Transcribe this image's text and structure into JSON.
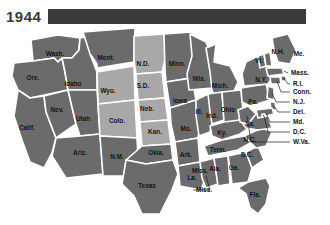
{
  "header": {
    "year": "1944",
    "bar_color": "#3a3a3a"
  },
  "legend": {
    "dark_color": "#6b6b6b",
    "light_color": "#a8a8a8",
    "border_color": "#ffffff"
  },
  "map": {
    "title": "1944",
    "states": [
      {
        "code": "WA",
        "label": "Wash.",
        "shade": "dark",
        "lx": 55,
        "ly": 26
      },
      {
        "code": "OR",
        "label": "Ore.",
        "shade": "dark",
        "lx": 33,
        "ly": 50
      },
      {
        "code": "CA",
        "label": "Calif.",
        "shade": "dark",
        "lx": 27,
        "ly": 100
      },
      {
        "code": "NV",
        "label": "Nev.",
        "shade": "dark",
        "lx": 57,
        "ly": 82
      },
      {
        "code": "ID",
        "label": "Idaho",
        "shade": "dark",
        "lx": 73,
        "ly": 56
      },
      {
        "code": "MT",
        "label": "Mont.",
        "shade": "dark",
        "lx": 106,
        "ly": 30
      },
      {
        "code": "WY",
        "label": "Wyo.",
        "shade": "light",
        "lx": 108,
        "ly": 63
      },
      {
        "code": "UT",
        "label": "Utah",
        "shade": "dark",
        "lx": 83,
        "ly": 91
      },
      {
        "code": "AZ",
        "label": "Ariz.",
        "shade": "dark",
        "lx": 80,
        "ly": 125
      },
      {
        "code": "CO",
        "label": "Colo.",
        "shade": "light",
        "lx": 117,
        "ly": 93
      },
      {
        "code": "NM",
        "label": "N.M.",
        "shade": "dark",
        "lx": 117,
        "ly": 129
      },
      {
        "code": "ND",
        "label": "N.D.",
        "shade": "light",
        "lx": 143,
        "ly": 36
      },
      {
        "code": "SD",
        "label": "S.D.",
        "shade": "light",
        "lx": 143,
        "ly": 58
      },
      {
        "code": "NE",
        "label": "Neb.",
        "shade": "light",
        "lx": 147,
        "ly": 81
      },
      {
        "code": "KS",
        "label": "Kan.",
        "shade": "light",
        "lx": 155,
        "ly": 104
      },
      {
        "code": "OK",
        "label": "Okla.",
        "shade": "dark",
        "lx": 156,
        "ly": 125
      },
      {
        "code": "TX",
        "label": "Texas",
        "shade": "dark",
        "lx": 147,
        "ly": 158
      },
      {
        "code": "MN",
        "label": "Minn.",
        "shade": "dark",
        "lx": 177,
        "ly": 36
      },
      {
        "code": "IA",
        "label": "Iowa",
        "shade": "dark",
        "lx": 180,
        "ly": 73
      },
      {
        "code": "MO",
        "label": "Mo.",
        "shade": "dark",
        "lx": 186,
        "ly": 101
      },
      {
        "code": "AR",
        "label": "Ark.",
        "shade": "dark",
        "lx": 186,
        "ly": 127
      },
      {
        "code": "LA",
        "label": "La.",
        "shade": "dark",
        "lx": 192,
        "ly": 150
      },
      {
        "code": "WI",
        "label": "Wis.",
        "shade": "dark",
        "lx": 199,
        "ly": 51
      },
      {
        "code": "IL",
        "label": "Ill.",
        "shade": "dark",
        "lx": 199,
        "ly": 84
      },
      {
        "code": "MI",
        "label": "Mich.",
        "shade": "dark",
        "lx": 220,
        "ly": 58
      },
      {
        "code": "IN",
        "label": "Ind.",
        "shade": "dark",
        "lx": 212,
        "ly": 88
      },
      {
        "code": "OH",
        "label": "Ohio",
        "shade": "dark",
        "lx": 228,
        "ly": 82
      },
      {
        "code": "KY",
        "label": "Ky.",
        "shade": "dark",
        "lx": 222,
        "ly": 105
      },
      {
        "code": "TN",
        "label": "Tenn.",
        "shade": "dark",
        "lx": 218,
        "ly": 122
      },
      {
        "code": "MS",
        "label": "Miss.",
        "shade": "dark",
        "lx": 200,
        "ly": 143
      },
      {
        "code": "AL",
        "label": "Ala.",
        "shade": "dark",
        "lx": 215,
        "ly": 141
      },
      {
        "code": "GA",
        "label": "Ga.",
        "shade": "dark",
        "lx": 234,
        "ly": 140
      },
      {
        "code": "FL",
        "label": "Fla.",
        "shade": "dark",
        "lx": 255,
        "ly": 167
      },
      {
        "code": "SC",
        "label": "S.C.",
        "shade": "dark",
        "lx": 247,
        "ly": 127
      },
      {
        "code": "NC",
        "label": "N.C.",
        "shade": "dark",
        "lx": 250,
        "ly": 112
      },
      {
        "code": "VA",
        "label": "Va.",
        "shade": "dark",
        "lx": 250,
        "ly": 96
      },
      {
        "code": "PA",
        "label": "Pa.",
        "shade": "dark",
        "lx": 253,
        "ly": 74
      },
      {
        "code": "NY",
        "label": "N.Y.",
        "shade": "dark",
        "lx": 261,
        "ly": 52
      },
      {
        "code": "VT",
        "label": "Vt.",
        "shade": "dark",
        "lx": 259,
        "ly": 33
      },
      {
        "code": "NH",
        "label": "N.H.",
        "shade": "dark",
        "lx": 278,
        "ly": 24
      },
      {
        "code": "ME",
        "label": "Me.",
        "shade": "dark",
        "lx": 299,
        "ly": 26
      }
    ],
    "callouts": [
      {
        "code": "MA",
        "label": "Mass.",
        "shade": "dark",
        "tx": 291,
        "ty": 45,
        "align": "start"
      },
      {
        "code": "RI",
        "label": "R.I.",
        "shade": "dark",
        "tx": 293,
        "ty": 56,
        "align": "start"
      },
      {
        "code": "CT",
        "label": "Conn.",
        "shade": "dark",
        "tx": 293,
        "ty": 64,
        "align": "start"
      },
      {
        "code": "NJ",
        "label": "N.J.",
        "shade": "dark",
        "tx": 293,
        "ty": 74,
        "align": "start"
      },
      {
        "code": "DE",
        "label": "Del.",
        "shade": "dark",
        "tx": 293,
        "ty": 84,
        "align": "start"
      },
      {
        "code": "MD",
        "label": "Md.",
        "shade": "dark",
        "tx": 293,
        "ty": 94,
        "align": "start"
      },
      {
        "code": "DC",
        "label": "D.C.",
        "shade": "dark",
        "tx": 293,
        "ty": 104,
        "align": "start"
      },
      {
        "code": "WV",
        "label": "W.Va.",
        "shade": "dark",
        "tx": 293,
        "ty": 114,
        "align": "start"
      },
      {
        "code": "MS2",
        "label": "Miss.",
        "shade": "dark",
        "tx": 196,
        "ty": 162,
        "align": "start"
      }
    ]
  }
}
